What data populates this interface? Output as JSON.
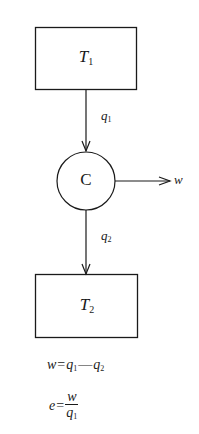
{
  "diagram": {
    "type": "heat-engine-flow",
    "nodes": {
      "hot_reservoir": {
        "symbol": "T",
        "subscript": "1"
      },
      "engine": {
        "label": "C"
      },
      "cold_reservoir": {
        "symbol": "T",
        "subscript": "2"
      }
    },
    "flows": {
      "q1": {
        "symbol": "q",
        "subscript": "1"
      },
      "q2": {
        "symbol": "q",
        "subscript": "2"
      },
      "work": {
        "symbol": "w"
      }
    },
    "equations": {
      "work": {
        "lhs": "w",
        "eq": "=",
        "a": "q",
        "a_sub": "1",
        "minus": "—",
        "b": "q",
        "b_sub": "2"
      },
      "efficiency": {
        "lhs": "e",
        "eq": "=",
        "num": "w",
        "den": "q",
        "den_sub": "1"
      }
    },
    "colors": {
      "line": "#1a1a1a",
      "background": "#ffffff"
    }
  }
}
